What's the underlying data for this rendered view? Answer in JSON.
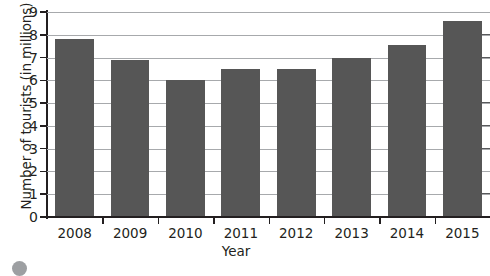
{
  "chart_data": {
    "type": "bar",
    "title": "",
    "xlabel": "Year",
    "ylabel": "Number of tourists (in millions)",
    "categories": [
      "2008",
      "2009",
      "2010",
      "2011",
      "2012",
      "2013",
      "2014",
      "2015"
    ],
    "values": [
      7.8,
      6.9,
      6.0,
      6.5,
      6.5,
      7.0,
      7.55,
      8.6
    ],
    "ylim": [
      0,
      9
    ],
    "yticks": [
      0,
      1,
      2,
      3,
      4,
      5,
      6,
      7,
      8,
      9
    ],
    "ytick_labels": [
      "0",
      "1",
      "2",
      "3",
      "4",
      "5",
      "6",
      "7",
      "8",
      "9"
    ],
    "grid": true,
    "grid_axis": "y",
    "legend": false,
    "legend_position": "none",
    "bar_color": "#565656",
    "gridline_color": "#a7a9ac",
    "axis_color": "#231f20",
    "background_color": "#ffffff"
  },
  "decor": {
    "cropped_bullet_color": "#9d9fa2"
  }
}
